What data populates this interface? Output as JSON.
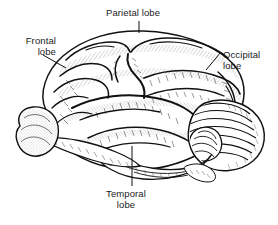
{
  "figure": {
    "background_color": "#ffffff",
    "ink_color": "#111111",
    "width": 278,
    "height": 225
  },
  "labels": {
    "parietal": {
      "line1": "Parietal lobe"
    },
    "frontal": {
      "line1": "Frontal",
      "line2": "lobe"
    },
    "occipital": {
      "line1": "Occipital",
      "line2": "lobe"
    },
    "temporal": {
      "line1": "Temporal",
      "line2": "lobe"
    }
  },
  "structures": [
    {
      "name": "cerebral-cortex",
      "region": "frontal-lobe"
    },
    {
      "name": "cerebral-cortex",
      "region": "parietal-lobe"
    },
    {
      "name": "cerebral-cortex",
      "region": "occipital-lobe"
    },
    {
      "name": "cerebral-cortex",
      "region": "temporal-lobe"
    },
    {
      "name": "cerebellum",
      "region": "hindbrain"
    },
    {
      "name": "olfactory-bulb",
      "region": "ventral-frontal"
    },
    {
      "name": "brainstem",
      "region": "ventral"
    }
  ],
  "leaders": [
    {
      "name": "parietal-leader",
      "type": "vertical-tick"
    },
    {
      "name": "frontal-leader",
      "type": "diagonal"
    },
    {
      "name": "occipital-leader",
      "type": "diagonal"
    },
    {
      "name": "temporal-leader",
      "type": "vertical"
    }
  ]
}
